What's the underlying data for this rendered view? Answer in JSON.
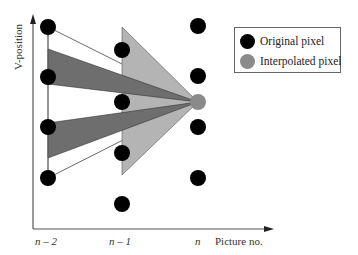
{
  "axes": {
    "ylabel": "V-position",
    "xlabel": "Picture no.",
    "xticks": [
      "n – 2",
      "n – 1",
      "n"
    ]
  },
  "legend": {
    "items": [
      {
        "label": "Original pixel",
        "color": "#000000"
      },
      {
        "label": "Interpolated pixel",
        "color": "#8a8a8a"
      }
    ]
  },
  "colors": {
    "original_pixel": "#000000",
    "interpolated_pixel": "#8a8a8a",
    "light_wedge": "#b4b4b4",
    "dark_band": "#6e6e6e",
    "axis": "#555555"
  },
  "columns": [
    {
      "name": "n-2",
      "x": 48,
      "pixels_y": [
        27,
        77,
        127,
        178
      ]
    },
    {
      "name": "n-1",
      "x": 122,
      "pixels_y": [
        50,
        102,
        153,
        204
      ]
    },
    {
      "name": "n",
      "x": 198,
      "pixels_y": [
        26,
        76,
        127,
        178
      ],
      "interpolated_y": 102
    }
  ]
}
